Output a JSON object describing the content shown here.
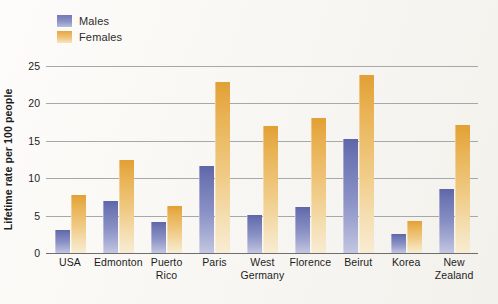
{
  "chart_data": {
    "type": "bar",
    "title": "",
    "xlabel": "",
    "ylabel": "Lifetime rate per 100 people",
    "categories": [
      "USA",
      "Edmonton",
      "Puerto Rico",
      "Paris",
      "West Germany",
      "Florence",
      "Beirut",
      "Korea",
      "New Zealand"
    ],
    "category_lines": [
      [
        "USA"
      ],
      [
        "Edmonton"
      ],
      [
        "Puerto",
        "Rico"
      ],
      [
        "Paris"
      ],
      [
        "West",
        "Germany"
      ],
      [
        "Florence"
      ],
      [
        "Beirut"
      ],
      [
        "Korea"
      ],
      [
        "New",
        "Zealand"
      ]
    ],
    "series": [
      {
        "name": "Males",
        "color": "#7279b5",
        "values": [
          3.1,
          6.9,
          4.2,
          11.6,
          5.1,
          6.2,
          15.2,
          2.5,
          8.6
        ]
      },
      {
        "name": "Females",
        "color": "#e6a740",
        "values": [
          7.8,
          12.5,
          6.3,
          22.8,
          17.0,
          18.1,
          23.8,
          4.3,
          17.1
        ]
      }
    ],
    "ylim": [
      0,
      25
    ],
    "yticks": [
      0,
      5,
      10,
      15,
      20,
      25
    ],
    "ytick_labels": [
      "0",
      "5",
      "10",
      "15",
      "20",
      "25"
    ],
    "grid": true,
    "legend_position": "top-left"
  },
  "legend": {
    "items": [
      {
        "label": "Males"
      },
      {
        "label": "Females"
      }
    ]
  },
  "colors": {
    "males": "#7279b5",
    "females": "#e6a740",
    "gridline": "#a8a8a8",
    "axis": "#6e6e6e",
    "text": "#1d1d1d",
    "background": "#fbfaf7"
  }
}
